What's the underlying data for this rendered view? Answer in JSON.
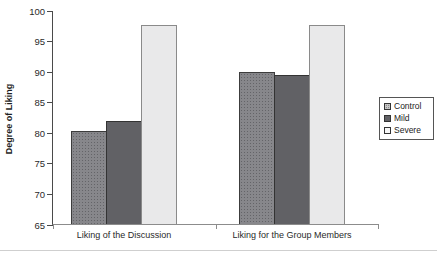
{
  "chart_data": {
    "type": "bar",
    "title": "",
    "categories": [
      "Liking of the Discussion",
      "Liking for the Group Members"
    ],
    "series": [
      {
        "name": "Control",
        "values": [
          80.2,
          89.9
        ],
        "fill": "#87878b",
        "border": "#3c3c3c",
        "pattern": "dots",
        "legend_swatch_fill": "#c8c8c8"
      },
      {
        "name": "Mild",
        "values": [
          81.8,
          89.3
        ],
        "fill": "#616165",
        "border": "#333333",
        "pattern": "solid",
        "legend_swatch_fill": "#616165"
      },
      {
        "name": "Severe",
        "values": [
          97.6,
          97.6
        ],
        "fill": "#e9e9ea",
        "border": "#8a8a8a",
        "pattern": "solid",
        "legend_swatch_fill": "#f7f7f7"
      }
    ],
    "xlabel": "",
    "ylabel": "Degree of Liking",
    "ylim": [
      65,
      100
    ],
    "ytick_step": 5,
    "ytick_labels": [
      "65",
      "70",
      "75",
      "80",
      "85",
      "90",
      "95",
      "100"
    ],
    "grid": false,
    "legend": {
      "position": "right",
      "entries": [
        "Control",
        "Mild",
        "Severe"
      ]
    }
  }
}
